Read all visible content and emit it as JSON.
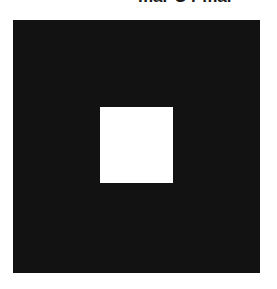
{
  "caption": {
    "text": "mar C r mal"
  },
  "figure": {
    "outer_color": "#121212",
    "inner_color": "#ffffff",
    "background": "#ffffff"
  }
}
